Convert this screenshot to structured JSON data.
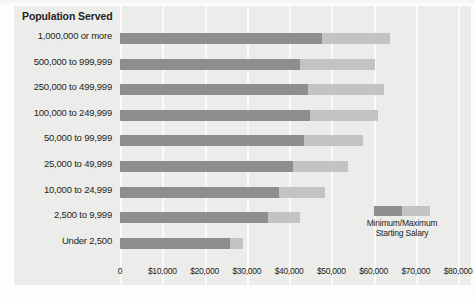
{
  "chart_data": {
    "type": "bar",
    "subtype": "horizontal-range-bar",
    "title": "Population Served",
    "xlabel": "",
    "ylabel": "Population Served",
    "xlim": [
      0,
      80000
    ],
    "grid": true,
    "legend_position": "inside-right",
    "categories": [
      "1,000,000 or more",
      "500,000 to 999,999",
      "250,000 to 499,999",
      "100,000 to 249,999",
      "50,000 to 99,999",
      "25,000 to 49,999",
      "10,000 to 24,999",
      "2,500 to 9,999",
      "Under 2,500"
    ],
    "series": [
      {
        "name": "Minimum Starting Salary",
        "values": [
          47800,
          42600,
          44600,
          44900,
          43500,
          41000,
          37600,
          35000,
          26000
        ]
      },
      {
        "name": "Maximum Starting Salary",
        "values": [
          64000,
          60400,
          62400,
          61000,
          57500,
          54000,
          48500,
          42500,
          29100
        ]
      }
    ],
    "xticks": [
      0,
      10000,
      20000,
      30000,
      40000,
      50000,
      60000,
      70000,
      80000
    ],
    "xtick_labels": [
      "0",
      "$10,000",
      "$20,000",
      "$30,000",
      "$40,000",
      "$50,000",
      "$60,000",
      "$70,000",
      "$80,000"
    ],
    "legend_entries": [
      "Minimum/Maximum",
      "Starting Salary"
    ],
    "colors": {
      "min_segment": "#8e8e8e",
      "max_segment": "#c3c3c2",
      "panel_background": "#ececeb",
      "gridline": "#fbfbfa",
      "text": "#231f20"
    }
  },
  "title": {
    "text": "Population Served"
  },
  "legend": {
    "line1": "Minimum/Maximum",
    "line2": "Starting Salary"
  }
}
